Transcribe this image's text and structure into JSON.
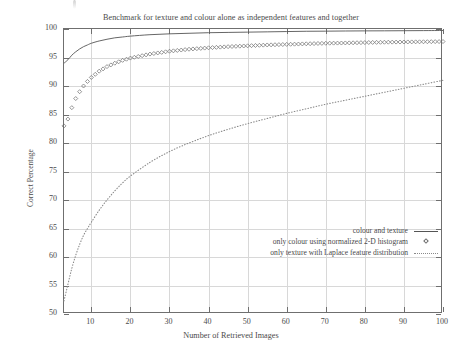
{
  "chart_data": {
    "type": "line",
    "title": "Benchmark for texture and colour alone as independent features and together",
    "xlabel": "Number of Retrieved Images",
    "ylabel": "Correct Percentage",
    "xlim": [
      3,
      100
    ],
    "ylim": [
      50,
      100
    ],
    "xticks": [
      10,
      20,
      30,
      40,
      50,
      60,
      70,
      80,
      90,
      100
    ],
    "yticks": [
      50,
      55,
      60,
      65,
      70,
      75,
      80,
      85,
      90,
      95,
      100
    ],
    "grid": true,
    "legend_position": "lower-right-inside",
    "series": [
      {
        "name": "colour and texture",
        "style": "solid-line",
        "color": "#555555",
        "x": [
          3,
          4,
          5,
          6,
          7,
          8,
          9,
          10,
          12,
          14,
          16,
          18,
          20,
          25,
          30,
          35,
          40,
          45,
          50,
          55,
          60,
          65,
          70,
          75,
          80,
          85,
          90,
          95,
          100
        ],
        "values": [
          94.0,
          94.6,
          95.4,
          96.0,
          96.5,
          96.9,
          97.2,
          97.5,
          97.9,
          98.2,
          98.45,
          98.6,
          98.75,
          99.0,
          99.15,
          99.25,
          99.35,
          99.4,
          99.45,
          99.5,
          99.55,
          99.6,
          99.62,
          99.65,
          99.67,
          99.68,
          99.7,
          99.72,
          99.74
        ]
      },
      {
        "name": "only colour using normalized 2-D histogram",
        "style": "diamond-markers",
        "color": "#6a6a6a",
        "x": [
          3,
          4,
          5,
          6,
          7,
          8,
          9,
          10,
          12,
          14,
          16,
          18,
          20,
          25,
          30,
          35,
          40,
          45,
          50,
          55,
          60,
          65,
          70,
          75,
          80,
          85,
          90,
          95,
          100
        ],
        "values": [
          83.0,
          84.2,
          86.2,
          87.8,
          89.0,
          90.0,
          90.8,
          91.5,
          92.6,
          93.4,
          94.0,
          94.5,
          94.9,
          95.6,
          96.1,
          96.45,
          96.7,
          96.9,
          97.05,
          97.2,
          97.3,
          97.4,
          97.5,
          97.55,
          97.62,
          97.68,
          97.72,
          97.76,
          97.8
        ]
      },
      {
        "name": "only texture with Laplace feature distribution",
        "style": "dotted-line",
        "color": "#8a8a8a",
        "x": [
          3,
          4,
          5,
          6,
          7,
          8,
          9,
          10,
          12,
          14,
          16,
          18,
          20,
          25,
          30,
          35,
          40,
          45,
          50,
          55,
          60,
          65,
          70,
          75,
          80,
          85,
          90,
          95,
          100
        ],
        "values": [
          52.3,
          55.2,
          58.0,
          60.3,
          62.2,
          63.8,
          65.0,
          66.1,
          68.2,
          70.0,
          71.6,
          73.0,
          74.2,
          76.6,
          78.5,
          80.0,
          81.3,
          82.4,
          83.4,
          84.3,
          85.2,
          86.0,
          86.8,
          87.5,
          88.2,
          88.9,
          89.6,
          90.3,
          91.0
        ]
      }
    ]
  },
  "legend": {
    "entries": [
      {
        "label": "colour and texture",
        "key": "solid-line-key"
      },
      {
        "label": "only colour using normalized 2-D histogram",
        "key": "diamond-marker-key"
      },
      {
        "label": "only texture with Laplace feature distribution",
        "key": "dotted-line-key"
      }
    ]
  }
}
